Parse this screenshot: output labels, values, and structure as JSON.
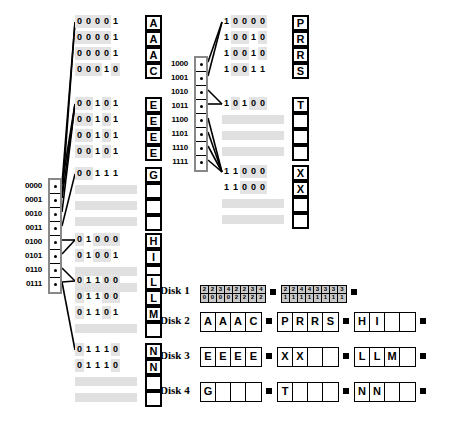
{
  "diagram": {
    "left_directory": {
      "name": "left-directory",
      "labels": [
        "0000",
        "0001",
        "0010",
        "0011",
        "0100",
        "0101",
        "0110",
        "0111"
      ]
    },
    "right_directory": {
      "name": "right-directory",
      "labels": [
        "1000",
        "1001",
        "1010",
        "1011",
        "1100",
        "1101",
        "1110",
        "1111"
      ]
    },
    "left_buckets": [
      {
        "id": "bucket-A",
        "rows": [
          {
            "bits": "00001",
            "letter": "A"
          },
          {
            "bits": "00001",
            "letter": "A"
          },
          {
            "bits": "00001",
            "letter": "A"
          },
          {
            "bits": "00010",
            "letter": "C"
          }
        ]
      },
      {
        "id": "bucket-E",
        "rows": [
          {
            "bits": "00101",
            "letter": "E"
          },
          {
            "bits": "00101",
            "letter": "E"
          },
          {
            "bits": "00101",
            "letter": "E"
          },
          {
            "bits": "00101",
            "letter": "E"
          }
        ]
      },
      {
        "id": "bucket-G",
        "rows": [
          {
            "bits": "00111",
            "letter": "G"
          },
          {
            "bits": "",
            "letter": ""
          },
          {
            "bits": "",
            "letter": ""
          },
          {
            "bits": "",
            "letter": ""
          }
        ]
      },
      {
        "id": "bucket-HI",
        "rows": [
          {
            "bits": "01000",
            "letter": "H"
          },
          {
            "bits": "01001",
            "letter": "I"
          },
          {
            "bits": "",
            "letter": ""
          },
          {
            "bits": "",
            "letter": ""
          }
        ]
      },
      {
        "id": "bucket-LLM",
        "rows": [
          {
            "bits": "01100",
            "letter": "L"
          },
          {
            "bits": "01100",
            "letter": "L"
          },
          {
            "bits": "01101",
            "letter": "M"
          },
          {
            "bits": "",
            "letter": ""
          }
        ]
      },
      {
        "id": "bucket-NN",
        "rows": [
          {
            "bits": "01110",
            "letter": "N"
          },
          {
            "bits": "01110",
            "letter": "N"
          },
          {
            "bits": "",
            "letter": ""
          },
          {
            "bits": "",
            "letter": ""
          }
        ]
      }
    ],
    "right_buckets": [
      {
        "id": "bucket-PRRS",
        "rows": [
          {
            "bits": "10000",
            "letter": "P"
          },
          {
            "bits": "10010",
            "letter": "R"
          },
          {
            "bits": "10010",
            "letter": "R"
          },
          {
            "bits": "10011",
            "letter": "S"
          }
        ]
      },
      {
        "id": "bucket-T",
        "rows": [
          {
            "bits": "10100",
            "letter": "T"
          },
          {
            "bits": "",
            "letter": ""
          },
          {
            "bits": "",
            "letter": ""
          },
          {
            "bits": "",
            "letter": ""
          }
        ]
      },
      {
        "id": "bucket-XX",
        "rows": [
          {
            "bits": "11000",
            "letter": "X"
          },
          {
            "bits": "11000",
            "letter": "X"
          },
          {
            "bits": "",
            "letter": ""
          },
          {
            "bits": "",
            "letter": ""
          }
        ]
      }
    ],
    "disks": [
      {
        "label": "Disk 1",
        "type": "numeric",
        "blocks": [
          {
            "top": [
              "2",
              "2",
              "3",
              "4",
              "2",
              "2",
              "3",
              "4"
            ],
            "bottom": [
              "0",
              "0",
              "0",
              "0",
              "2",
              "2",
              "2",
              "2"
            ]
          },
          {
            "top": [
              "2",
              "2",
              "4",
              "4",
              "3",
              "3",
              "3",
              "3"
            ],
            "bottom": [
              "1",
              "1",
              "1",
              "1",
              "1",
              "1",
              "1",
              "1"
            ]
          }
        ]
      },
      {
        "label": "Disk 2",
        "type": "letters",
        "blocks": [
          [
            "A",
            "A",
            "A",
            "C"
          ],
          [
            "P",
            "R",
            "R",
            "S"
          ],
          [
            "H",
            "I",
            "",
            ""
          ]
        ]
      },
      {
        "label": "Disk 3",
        "type": "letters",
        "blocks": [
          [
            "E",
            "E",
            "E",
            "E"
          ],
          [
            "X",
            "X",
            "",
            ""
          ],
          [
            "L",
            "L",
            "M",
            ""
          ]
        ]
      },
      {
        "label": "Disk 4",
        "type": "letters",
        "blocks": [
          [
            "G",
            "",
            "",
            ""
          ],
          [
            "T",
            "",
            "",
            ""
          ],
          [
            "N",
            "N",
            "",
            ""
          ]
        ]
      }
    ]
  }
}
